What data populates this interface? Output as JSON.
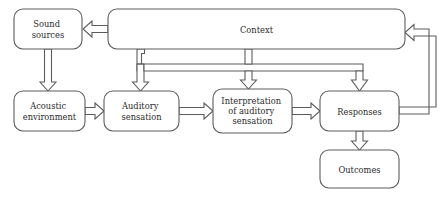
{
  "diagram": {
    "background_color": "#ffffff",
    "line_color": "#5c5c5c",
    "text_color": "#2b2b2b",
    "arrow_style": "hollow-double-line",
    "nodes": [
      {
        "id": "sound_sources",
        "label": "Sound sources",
        "lines": [
          "Sound",
          "sources"
        ],
        "x": 14,
        "y": 9,
        "w": 68,
        "h": 40
      },
      {
        "id": "context",
        "label": "Context",
        "lines": [
          "Context"
        ],
        "x": 108,
        "y": 9,
        "w": 297,
        "h": 40
      },
      {
        "id": "acoustic_env",
        "label": "Acoustic environment",
        "lines": [
          "Acoustic",
          "environment"
        ],
        "x": 14,
        "y": 91,
        "w": 71,
        "h": 40
      },
      {
        "id": "auditory_sens",
        "label": "Auditory sensation",
        "lines": [
          "Auditory",
          "sensation"
        ],
        "x": 104,
        "y": 91,
        "w": 75,
        "h": 40
      },
      {
        "id": "interpretation",
        "label": "Interpretation of auditory sensation",
        "lines": [
          "Interpretation",
          "of auditory",
          "sensation"
        ],
        "x": 213,
        "y": 89,
        "w": 79,
        "h": 44
      },
      {
        "id": "responses",
        "label": "Responses",
        "lines": [
          "Responses"
        ],
        "x": 320,
        "y": 91,
        "w": 79,
        "h": 40
      },
      {
        "id": "outcomes",
        "label": "Outcomes",
        "lines": [
          "Outcomes"
        ],
        "x": 320,
        "y": 150,
        "w": 79,
        "h": 38
      }
    ],
    "edges": [
      {
        "id": "context-to-sound-sources",
        "from": "context",
        "to": "sound_sources",
        "direction": "left"
      },
      {
        "id": "sound-sources-to-acoustic",
        "from": "sound_sources",
        "to": "acoustic_env",
        "direction": "down"
      },
      {
        "id": "context-to-auditory",
        "from": "context",
        "to": "auditory_sens",
        "direction": "down"
      },
      {
        "id": "context-to-interpretation",
        "from": "context",
        "to": "interpretation",
        "direction": "down"
      },
      {
        "id": "context-to-responses",
        "from": "context",
        "to": "responses",
        "direction": "down"
      },
      {
        "id": "acoustic-to-auditory",
        "from": "acoustic_env",
        "to": "auditory_sens",
        "direction": "right"
      },
      {
        "id": "auditory-to-interpretation",
        "from": "auditory_sens",
        "to": "interpretation",
        "direction": "right"
      },
      {
        "id": "interpretation-to-responses",
        "from": "interpretation",
        "to": "responses",
        "direction": "right"
      },
      {
        "id": "responses-to-outcomes",
        "from": "responses",
        "to": "outcomes",
        "direction": "down"
      },
      {
        "id": "responses-to-context",
        "from": "responses",
        "to": "context",
        "direction": "feedback-right"
      }
    ]
  }
}
